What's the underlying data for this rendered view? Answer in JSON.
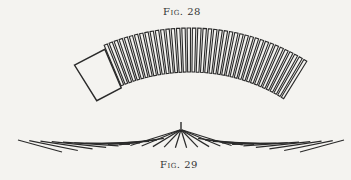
{
  "figures": [
    {
      "caption": "Fig. 28",
      "description": "curved row of rectangular segments forming an arc, with a larger box at the left end",
      "segment_count": 40,
      "arc": {
        "cx": 190,
        "cy": 250,
        "r_outer": 222,
        "r_inner": 178,
        "start_deg": -122,
        "end_deg": -58
      }
    },
    {
      "caption": "Fig. 29",
      "description": "fan of lines radiating from an apex down to a horizontal baseline",
      "apex": {
        "x": 181,
        "y": 122
      },
      "line_count": 30
    }
  ],
  "colors": {
    "ink": "#2a2a2a",
    "paper": "#f4f3f0"
  }
}
